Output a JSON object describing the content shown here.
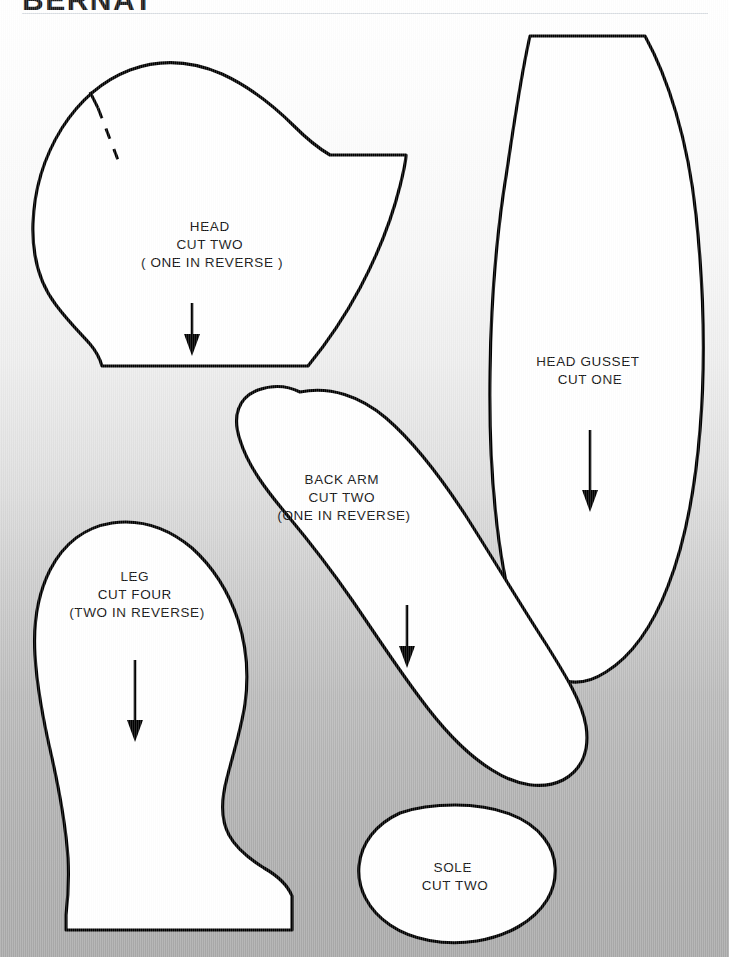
{
  "header": {
    "brand_title": "BERNAT",
    "rule_color": "#d9dde2"
  },
  "document": {
    "type": "sewing-pattern-sheet",
    "background_top_color": "#ffffff",
    "background_bottom_color": "#a9a9a9",
    "outline_color": "#000000",
    "piece_fill_color": "#ffffff"
  },
  "pieces": [
    {
      "id": "head",
      "name": "HEAD",
      "label_lines": [
        "HEAD",
        "CUT TWO",
        "( ONE IN REVERSE )"
      ],
      "line1": "HEAD",
      "line2": "CUT TWO",
      "line3": "( ONE IN REVERSE )",
      "has_grain_arrow": true,
      "has_dash_mark": true,
      "label_x": 212,
      "label_y": 231
    },
    {
      "id": "head-gusset",
      "name": "HEAD GUSSET",
      "label_lines": [
        "HEAD  GUSSET",
        "CUT  ONE"
      ],
      "line1": "HEAD  GUSSET",
      "line2": "CUT  ONE",
      "line3": "",
      "has_grain_arrow": true,
      "has_dash_mark": false,
      "label_x": 590,
      "label_y": 366
    },
    {
      "id": "back-arm",
      "name": "BACK ARM",
      "label_lines": [
        "BACK  ARM",
        "CUT  TWO",
        "(ONE  IN  REVERSE)"
      ],
      "line1": "BACK  ARM",
      "line2": "CUT  TWO",
      "line3": "(ONE  IN  REVERSE)",
      "has_grain_arrow": true,
      "has_dash_mark": false,
      "label_x": 344,
      "label_y": 484
    },
    {
      "id": "leg",
      "name": "LEG",
      "label_lines": [
        "LEG",
        "CUT  FOUR",
        "(TWO  IN  REVERSE)"
      ],
      "line1": "LEG",
      "line2": "CUT  FOUR",
      "line3": "(TWO  IN  REVERSE)",
      "has_grain_arrow": true,
      "has_dash_mark": false,
      "label_x": 137,
      "label_y": 581
    },
    {
      "id": "sole",
      "name": "SOLE",
      "label_lines": [
        "SOLE",
        "CUT TWO"
      ],
      "line1": "SOLE",
      "line2": "CUT TWO",
      "line3": "",
      "has_grain_arrow": false,
      "has_dash_mark": false,
      "label_x": 455,
      "label_y": 872
    }
  ]
}
